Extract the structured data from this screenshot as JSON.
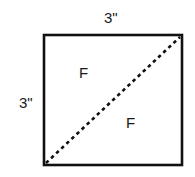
{
  "diagram": {
    "shape": "square",
    "dimensions": {
      "top": "3\"",
      "left": "3\""
    },
    "regions": [
      {
        "label": "F",
        "position": "upper-left triangle"
      },
      {
        "label": "F",
        "position": "lower-right triangle"
      }
    ],
    "fold_line": {
      "style": "dashed",
      "from": "bottom-left",
      "to": "top-right"
    },
    "colors": {
      "stroke": "#111111",
      "text": "#1a1a1a",
      "background": "#ffffff"
    }
  }
}
